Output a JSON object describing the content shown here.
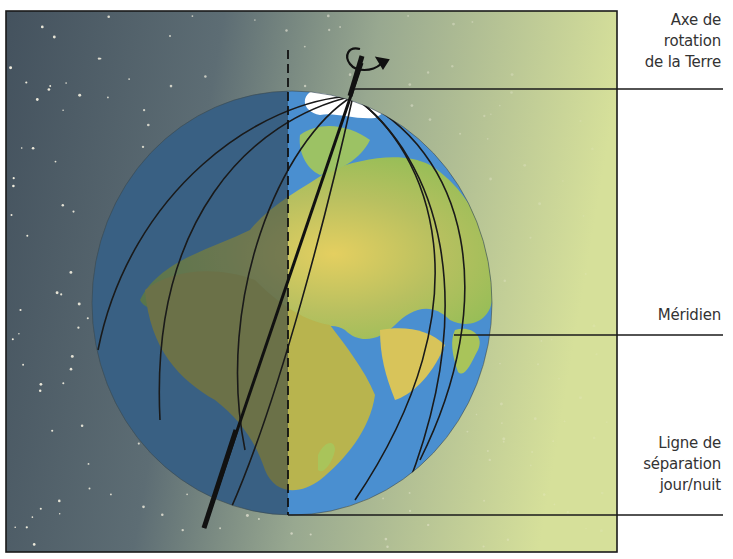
{
  "diagram": {
    "labels": {
      "axis": [
        "Axe de",
        "rotation",
        "de la Terre"
      ],
      "meridian": [
        "Méridien"
      ],
      "terminator": [
        "Ligne de",
        "séparation",
        "jour/nuit"
      ]
    },
    "colors": {
      "night_sky": "#4a5a66",
      "day_sky": "#d8e2a0",
      "ocean": "#4a8fd0",
      "land_green": "#8cc25a",
      "land_tan": "#d9b85a",
      "ice": "#ffffff",
      "frame": "#1a1a1a",
      "label_text": "#333333"
    }
  }
}
